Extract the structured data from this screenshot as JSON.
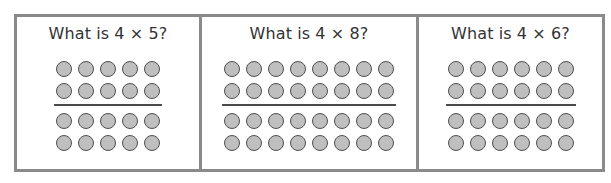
{
  "colors": {
    "border": "#8a8a8a",
    "dot_fill": "#bfbfbf",
    "dot_stroke": "#4f4f4f",
    "divider": "#4a4a4a",
    "text": "#333333"
  },
  "panels": [
    {
      "title": "What is 4 × 5?",
      "rows": 4,
      "columns": 5,
      "divider_after_row": 2,
      "width": 182
    },
    {
      "title": "What is 4 × 8?",
      "rows": 4,
      "columns": 8,
      "divider_after_row": 2,
      "width": 217
    },
    {
      "title": "What is 4 × 6?",
      "rows": 4,
      "columns": 6,
      "divider_after_row": 2,
      "width": 186
    }
  ]
}
